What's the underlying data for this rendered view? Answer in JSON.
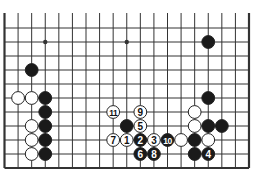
{
  "diagram": {
    "type": "go-board-diagram",
    "columns": 19,
    "visible_rows": 11,
    "top_edge_open": true,
    "colors": {
      "line": "#333333",
      "black_stone": "#1a1a1a",
      "white_stone": "#ffffff",
      "stone_outline": "#222222",
      "background": "#ffffff"
    },
    "star_points": [
      {
        "col": 3,
        "row": 1
      },
      {
        "col": 9,
        "row": 1
      }
    ],
    "stones": [
      {
        "color": "black",
        "col": 15,
        "row": 1,
        "label": ""
      },
      {
        "color": "black",
        "col": 2,
        "row": 3,
        "label": ""
      },
      {
        "color": "white",
        "col": 1,
        "row": 5,
        "label": ""
      },
      {
        "color": "white",
        "col": 2,
        "row": 5,
        "label": ""
      },
      {
        "color": "black",
        "col": 3,
        "row": 5,
        "label": ""
      },
      {
        "color": "black",
        "col": 15,
        "row": 5,
        "label": ""
      },
      {
        "color": "black",
        "col": 3,
        "row": 6,
        "label": ""
      },
      {
        "color": "white",
        "col": 8,
        "row": 6,
        "label": "11"
      },
      {
        "color": "white",
        "col": 10,
        "row": 6,
        "label": "9"
      },
      {
        "color": "white",
        "col": 14,
        "row": 6,
        "label": ""
      },
      {
        "color": "white",
        "col": 2,
        "row": 7,
        "label": ""
      },
      {
        "color": "black",
        "col": 3,
        "row": 7,
        "label": ""
      },
      {
        "color": "black",
        "col": 9,
        "row": 7,
        "label": ""
      },
      {
        "color": "white",
        "col": 10,
        "row": 7,
        "label": "5"
      },
      {
        "color": "white",
        "col": 14,
        "row": 7,
        "label": ""
      },
      {
        "color": "black",
        "col": 15,
        "row": 7,
        "label": ""
      },
      {
        "color": "black",
        "col": 16,
        "row": 7,
        "label": ""
      },
      {
        "color": "white",
        "col": 2,
        "row": 8,
        "label": ""
      },
      {
        "color": "black",
        "col": 3,
        "row": 8,
        "label": ""
      },
      {
        "color": "white",
        "col": 8,
        "row": 8,
        "label": "7"
      },
      {
        "color": "white",
        "col": 9,
        "row": 8,
        "label": "1"
      },
      {
        "color": "black",
        "col": 10,
        "row": 8,
        "label": "2"
      },
      {
        "color": "white",
        "col": 11,
        "row": 8,
        "label": "3"
      },
      {
        "color": "black",
        "col": 12,
        "row": 8,
        "label": "10"
      },
      {
        "color": "white",
        "col": 13,
        "row": 8,
        "label": ""
      },
      {
        "color": "black",
        "col": 14,
        "row": 8,
        "label": ""
      },
      {
        "color": "white",
        "col": 15,
        "row": 8,
        "label": ""
      },
      {
        "color": "white",
        "col": 2,
        "row": 9,
        "label": ""
      },
      {
        "color": "black",
        "col": 3,
        "row": 9,
        "label": ""
      },
      {
        "color": "black",
        "col": 10,
        "row": 9,
        "label": "6"
      },
      {
        "color": "black",
        "col": 11,
        "row": 9,
        "label": "8"
      },
      {
        "color": "black",
        "col": 14,
        "row": 9,
        "label": ""
      },
      {
        "color": "black",
        "col": 15,
        "row": 9,
        "label": "4"
      }
    ]
  }
}
